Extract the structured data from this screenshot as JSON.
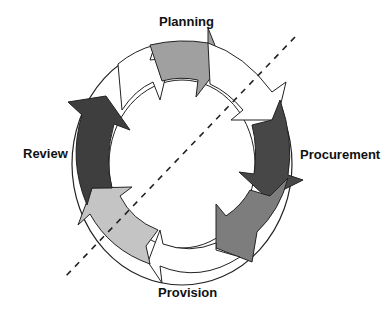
{
  "diagram": {
    "type": "cycle",
    "labels": {
      "planning": "Planning",
      "procurement": "Procurement",
      "provision": "Provision",
      "review": "Review"
    },
    "stages": [
      {
        "name": "Planning",
        "fill": "#a0a0a0"
      },
      {
        "name": "Planning-to-Procurement transition",
        "fill": "#ffffff"
      },
      {
        "name": "Procurement",
        "fill": "#474747"
      },
      {
        "name": "Procurement-to-Provision",
        "fill": "#7d7d7d"
      },
      {
        "name": "Provision",
        "fill": "#ffffff"
      },
      {
        "name": "Provision-to-Review",
        "fill": "#c4c4c4"
      },
      {
        "name": "Review",
        "fill": "#3e3e3e"
      },
      {
        "name": "Review-to-Planning",
        "fill": "#ffffff"
      }
    ],
    "divider": {
      "style": "dashed",
      "color": "#222222"
    }
  }
}
